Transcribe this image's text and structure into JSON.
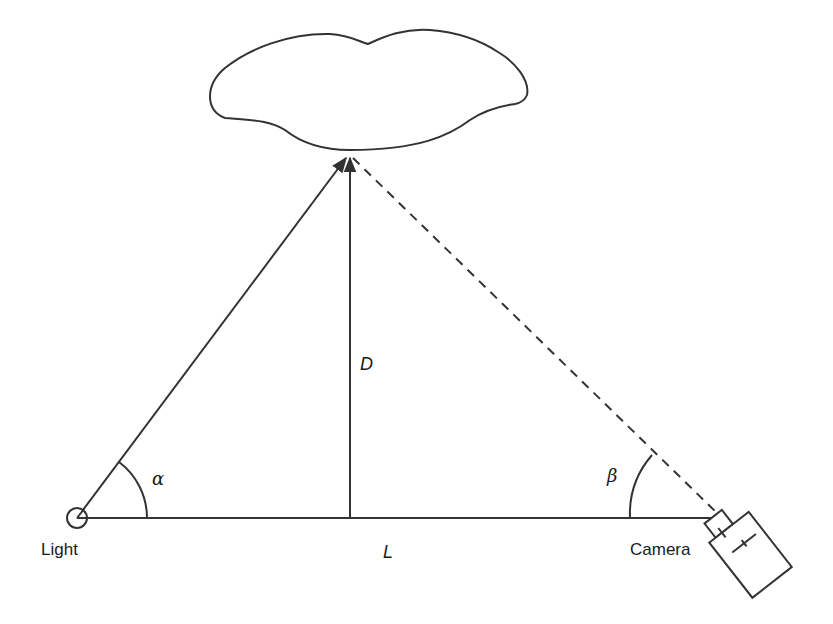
{
  "diagram": {
    "type": "triangulation-geometry",
    "stroke_color": "#333333",
    "nodes": {
      "light": {
        "label": "Light",
        "x": 77,
        "y": 518
      },
      "camera": {
        "label": "Camera",
        "x": 718,
        "y": 518
      },
      "target": {
        "label": "",
        "x": 350,
        "y": 155
      }
    },
    "labels": {
      "distance": "D",
      "baseline": "L",
      "angle_light": "α",
      "angle_camera": "β"
    },
    "edges": [
      {
        "from": "light",
        "to": "target",
        "style": "solid-arrow"
      },
      {
        "from": "light",
        "to": "camera",
        "style": "solid"
      },
      {
        "from": "baseline-mid",
        "to": "target",
        "style": "solid-arrow"
      },
      {
        "from": "target",
        "to": "camera",
        "style": "dashed"
      }
    ]
  }
}
